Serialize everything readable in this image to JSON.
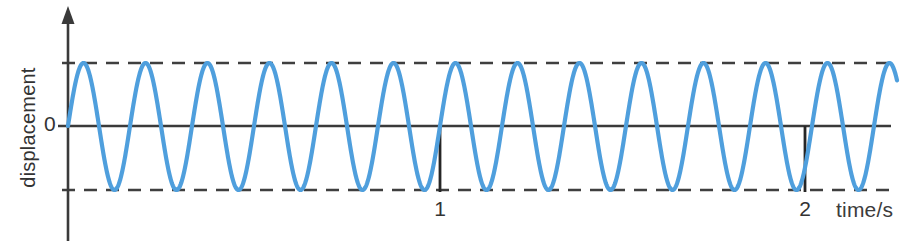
{
  "figure": {
    "kind": "displacement-time-graph",
    "background_color": "#ffffff"
  },
  "axes": {
    "y_axis": {
      "label": "displacement",
      "zero_label": "0",
      "has_arrow_head": true,
      "color": "#3a3a3a"
    },
    "x_axis": {
      "label": "time/s",
      "tick_labels": [
        "1",
        "2"
      ],
      "color": "#3a3a3a"
    },
    "envelope_lines": {
      "style": "dashed",
      "color": "#3f3f3f",
      "count": 2
    }
  },
  "chart_data": {
    "type": "line",
    "title": "",
    "xlabel": "time/s",
    "ylabel": "displacement",
    "xlim": [
      0,
      2.27
    ],
    "ylim": [
      -1.08,
      1.08
    ],
    "grid": false,
    "legend": null,
    "annotations": [
      "upper dashed envelope at displacement = +amplitude",
      "lower dashed envelope at displacement = -amplitude",
      "vertical tick marker at t = 1 s",
      "vertical tick marker at t = 2 s"
    ],
    "xticks": [
      1,
      2
    ],
    "xticklabels": [
      "1",
      "2"
    ],
    "yticks": [
      0
    ],
    "yticklabels": [
      "0"
    ],
    "series": [
      {
        "name": "displacement",
        "waveform": "sine",
        "amplitude": 1.0,
        "frequency_hz": 6,
        "period_s": 0.1667,
        "phase_rad": 0,
        "color": "#4f9fdd",
        "line_width": 4,
        "cycles_drawn": 13.6,
        "equation": "y = A sin(2*pi*6*t)"
      }
    ],
    "envelope": {
      "upper": 1.0,
      "lower": -1.0,
      "style": "dashed"
    }
  }
}
